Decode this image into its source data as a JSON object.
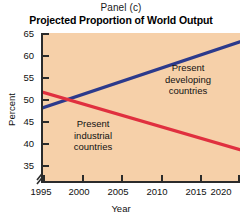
{
  "panel": {
    "label": "Panel (c)"
  },
  "title": "Projected Proportion of World Output",
  "axes": {
    "ylabel": "Percent",
    "xlabel": "Year",
    "yticks": [
      "65",
      "60",
      "55",
      "50",
      "45",
      "40",
      "35"
    ],
    "xticks": [
      "1995",
      "2000",
      "2005",
      "2010",
      "2015",
      "2020"
    ],
    "break_symbol": "axis-break"
  },
  "annotations": {
    "developing": "Present\ndeveloping\ncountries",
    "industrial": "Present\nindustrial\ncountries"
  },
  "colors": {
    "plot_background": "#f6d0a9",
    "developing_line": "#2c3a8c",
    "industrial_line": "#e0303f",
    "axis": "#2b2b2b",
    "page_background": "#ffffff"
  },
  "chart_data": {
    "type": "line",
    "title": "Projected Proportion of World Output",
    "subtitle": "Panel (c)",
    "xlabel": "Year",
    "ylabel": "Percent",
    "xlim": [
      1995,
      2020
    ],
    "ylim": [
      33,
      65
    ],
    "ylim_visible": [
      35,
      65
    ],
    "ytick_values": [
      35,
      40,
      45,
      50,
      55,
      60,
      65
    ],
    "xtick_values": [
      1995,
      2000,
      2005,
      2010,
      2015,
      2020
    ],
    "axis_break": true,
    "grid": false,
    "legend": "inline-annotations",
    "x": [
      1995,
      2020
    ],
    "series": [
      {
        "name": "Present developing countries",
        "color": "#2c3a8c",
        "values": [
          48.0,
          63.0
        ]
      },
      {
        "name": "Present industrial countries",
        "color": "#e0303f",
        "values": [
          51.5,
          38.5
        ]
      }
    ],
    "crossover": {
      "year": 1999,
      "percent": 50.0
    }
  }
}
